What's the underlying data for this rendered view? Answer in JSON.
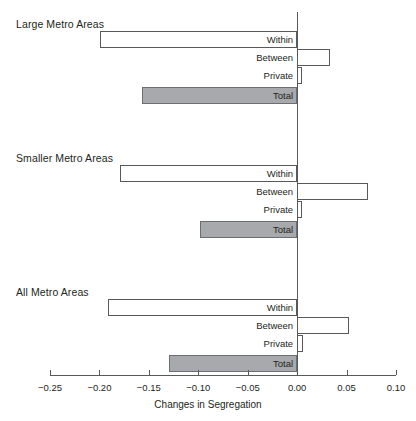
{
  "chart_data": {
    "type": "bar",
    "orientation": "horizontal",
    "title": "",
    "xlabel": "Changes in Segregation",
    "ylabel": "",
    "xlim": [
      -0.25,
      0.1
    ],
    "xticks": [
      -0.25,
      -0.2,
      -0.15,
      -0.1,
      -0.05,
      0.0,
      0.05,
      0.1
    ],
    "xtick_labels": [
      "−0.25",
      "−0.20",
      "−0.15",
      "−0.10",
      "−0.05",
      "0.00",
      "0.05",
      "0.10"
    ],
    "grid": false,
    "legend": "none",
    "zero_reference_line": true,
    "groups": [
      {
        "name": "Large Metro Areas",
        "categories": [
          "Within",
          "Between",
          "Private",
          "Total"
        ],
        "values": [
          -0.199,
          0.033,
          0.005,
          -0.157
        ]
      },
      {
        "name": "Smaller Metro Areas",
        "categories": [
          "Within",
          "Between",
          "Private",
          "Total"
        ],
        "values": [
          -0.179,
          0.072,
          0.005,
          -0.098
        ]
      },
      {
        "name": "All Metro Areas",
        "categories": [
          "Within",
          "Between",
          "Private",
          "Total"
        ],
        "values": [
          -0.191,
          0.052,
          0.006,
          -0.13
        ]
      }
    ],
    "colors": {
      "bar_fill": "#ffffff",
      "bar_stroke": "#58595b",
      "total_fill": "#a7a9ac",
      "total_stroke": "#6d6e71",
      "axis": "#58595b",
      "text": "#231f20",
      "background": "#ffffff"
    }
  },
  "layout": {
    "axis_y": 375,
    "x_min_px": 50,
    "x_max_px": 396,
    "zero_px": 297,
    "group_title_y": [
      18,
      152,
      286
    ],
    "group_first_bar_y": [
      31,
      165,
      299
    ],
    "bar_height": 17,
    "bar_gap": 1,
    "total_extra_gap": 2,
    "zero_line_top": 12,
    "zero_line_bottom": 375
  }
}
